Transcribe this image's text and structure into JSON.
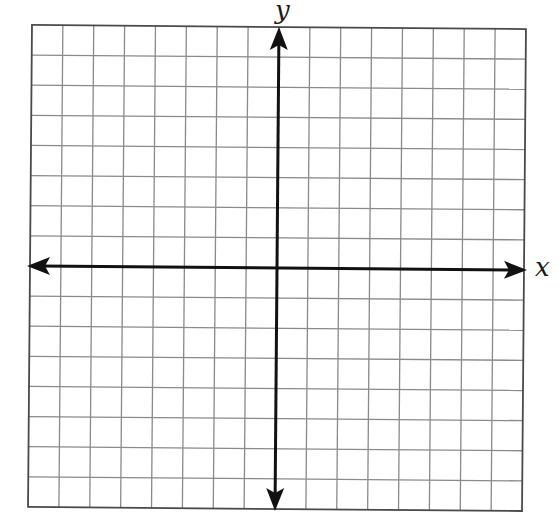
{
  "diagram": {
    "type": "coordinate-plane",
    "grid": {
      "columns": 16,
      "rows": 16,
      "origin_cell_offset": {
        "x": 8,
        "y": 8
      },
      "line_color": "#8a8a8a",
      "border_color": "#4a4a4a"
    },
    "axes": {
      "x_label": "x",
      "y_label": "y",
      "color": "#111111",
      "arrows": [
        "left",
        "right",
        "up",
        "down"
      ]
    }
  }
}
